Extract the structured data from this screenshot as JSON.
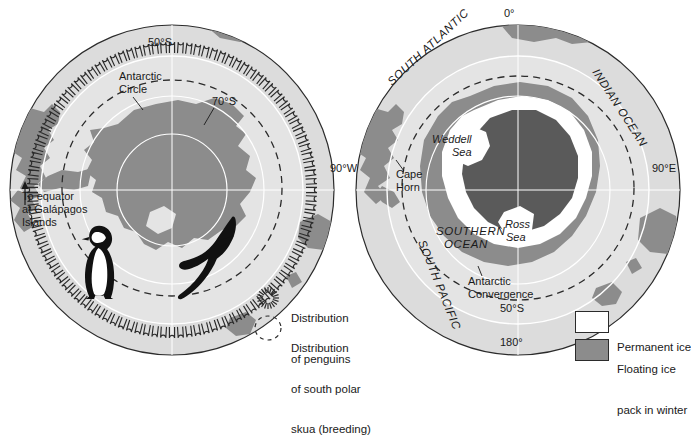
{
  "figure": {
    "colors": {
      "ocean_outer": "#dcdcdc",
      "ocean_inner": "#e2e2e2",
      "land": "#8c8c8c",
      "pack_ice": "#8c8c8c",
      "permanent_ice": "#ffffff",
      "line": "#2b2b2b",
      "graticule": "#ffffff",
      "text": "#1a1a1a"
    }
  },
  "left_map": {
    "name": "penguin-and-skua-distribution-map",
    "labels": {
      "lat50": "50°S",
      "lat70": "70°S",
      "antarctic_circle_line1": "Antarctic",
      "antarctic_circle_line2": "Circle",
      "equator_note_line1": "To equator",
      "equator_note_line2": "at Galápagos",
      "equator_note_line3": "Islands"
    },
    "illustrations": [
      {
        "name": "emperor-penguin",
        "label": "Emperor penguin silhouette"
      },
      {
        "name": "south-polar-skua",
        "label": "South polar skua in flight"
      }
    ]
  },
  "left_legend": {
    "items": [
      {
        "name": "legend-penguins",
        "symbol": "radial-hatch-icon",
        "line1": "Distribution",
        "line2": "of penguins",
        "line3": ""
      },
      {
        "name": "legend-skua",
        "symbol": "dashed-circle-icon",
        "line1": "Distribution",
        "line2": "of south polar",
        "line3": "skua (breeding)"
      }
    ]
  },
  "right_map": {
    "name": "southern-ocean-sea-ice-map",
    "labels": {
      "lon0": "0°",
      "lon90e": "90°E",
      "lon90w": "90°W",
      "lon180": "180°",
      "lat50": "50°S",
      "south_atlantic": "SOUTH ATLANTIC",
      "indian_ocean": "INDIAN OCEAN",
      "south_pacific": "SOUTH PACIFIC",
      "southern_ocean_line1": "SOUTHERN",
      "southern_ocean_line2": "OCEAN",
      "weddell_line1": "Weddell",
      "weddell_line2": "Sea",
      "ross_line1": "Ross",
      "ross_line2": "Sea",
      "cape_horn_line1": "Cape",
      "cape_horn_line2": "Horn",
      "convergence_line1": "Antarctic",
      "convergence_line2": "Convergence"
    }
  },
  "right_legend": {
    "items": [
      {
        "name": "legend-permanent-ice",
        "swatch": "#ffffff",
        "line1": "Permanent ice",
        "line2": ""
      },
      {
        "name": "legend-floating-ice",
        "swatch": "#8c8c8c",
        "line1": "Floating ice",
        "line2": "pack in winter"
      }
    ]
  }
}
